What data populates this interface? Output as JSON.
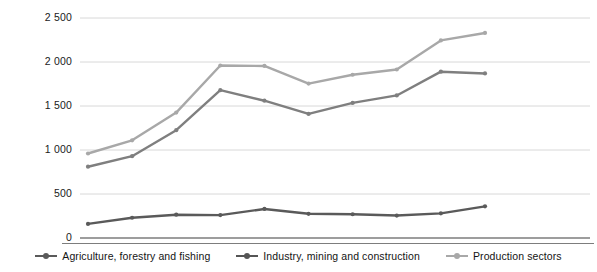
{
  "chart_data": {
    "type": "line",
    "title": "",
    "subtitle": "",
    "xlabel": "",
    "ylabel": "",
    "ylim": [
      0,
      2500
    ],
    "yticks": [
      0,
      500,
      1000,
      1500,
      2000,
      2500
    ],
    "ytick_labels": [
      "0",
      "500",
      "1 000",
      "1 500",
      "2 000",
      "2 500"
    ],
    "grid": true,
    "legend_position": "bottom",
    "x": [
      1,
      2,
      3,
      4,
      5,
      6,
      7,
      8,
      9,
      10
    ],
    "xtick_labels": [
      "",
      "",
      "",
      "",
      "",
      "",
      "",
      "",
      "",
      ""
    ],
    "series": [
      {
        "name": "Agriculture, forestry and fishing",
        "color": "#5a5a5a",
        "values": [
          160,
          230,
          265,
          260,
          330,
          275,
          270,
          255,
          280,
          360
        ]
      },
      {
        "name": "Industry, mining and construction",
        "color": "#7f7f7f",
        "values": [
          810,
          930,
          1225,
          1680,
          1560,
          1410,
          1535,
          1620,
          1890,
          1870
        ]
      },
      {
        "name": "Production sectors",
        "color": "#a8a8a8",
        "values": [
          960,
          1110,
          1425,
          1960,
          1955,
          1755,
          1855,
          1915,
          2245,
          2330
        ]
      }
    ]
  },
  "legend": {
    "items": [
      {
        "label": "Agriculture, forestry and fishing",
        "color": "#5a5a5a",
        "marker": "line-dot-marker"
      },
      {
        "label": "Industry, mining and construction",
        "color": "#555555",
        "marker": "line-dot-marker"
      },
      {
        "label": "Production sectors",
        "color": "#a8a8a8",
        "marker": "line-dot-marker"
      }
    ]
  },
  "axis": {
    "baseline_color": "#7d7d7d",
    "gridline_color": "#d4d4d4"
  }
}
